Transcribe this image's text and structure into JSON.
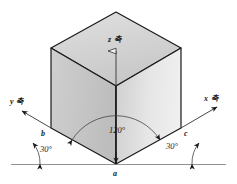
{
  "figure": {
    "background_color": "#ffffff",
    "line_color": "#1a1a1a",
    "faces": {
      "top_color": "#d4d4d4",
      "left_color": "#c9c9c9",
      "right_color": "#e3e3e3"
    }
  },
  "axes": [
    {
      "id": "z",
      "label": "z 축",
      "position": "top-center"
    },
    {
      "id": "y",
      "label": "y 축",
      "position": "left"
    },
    {
      "id": "x",
      "label": "x 축",
      "position": "right"
    }
  ],
  "vertices": [
    {
      "id": "a",
      "label": "a",
      "position": "bottom-center"
    },
    {
      "id": "b",
      "label": "b",
      "position": "bottom-left"
    },
    {
      "id": "c",
      "label": "c",
      "position": "bottom-right"
    }
  ],
  "angles": [
    {
      "id": "angle-120",
      "label": "120°",
      "value": 120,
      "unit": "degrees",
      "between": "front-left-edge and front-right-edge"
    },
    {
      "id": "angle-30-left",
      "label": "30°",
      "value": 30,
      "unit": "degrees",
      "between": "horizontal baseline and left bottom edge"
    },
    {
      "id": "angle-30-right",
      "label": "30°",
      "value": 30,
      "unit": "degrees",
      "between": "horizontal baseline and right bottom edge"
    }
  ],
  "baseline": {
    "label": "horizontal reference line"
  }
}
